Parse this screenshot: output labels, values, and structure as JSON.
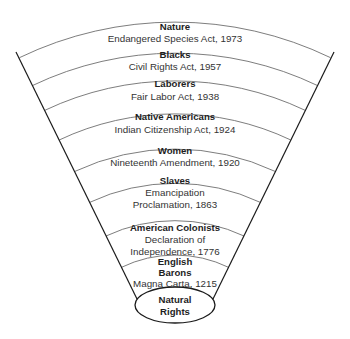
{
  "diagram": {
    "bands": [
      {
        "group": "Nature",
        "law_lines": [
          "Endangered Species Act, 1973"
        ]
      },
      {
        "group": "Blacks",
        "law_lines": [
          "Civil Rights Act, 1957"
        ]
      },
      {
        "group": "Laborers",
        "law_lines": [
          "Fair Labor Act, 1938"
        ]
      },
      {
        "group": "Native Americans",
        "law_lines": [
          "Indian Citizenship Act, 1924"
        ]
      },
      {
        "group": "Women",
        "law_lines": [
          "Nineteenth Amendment, 1920"
        ]
      },
      {
        "group": "Slaves",
        "law_lines": [
          "Emancipation",
          "Proclamation, 1863"
        ]
      },
      {
        "group": "American Colonists",
        "law_lines": [
          "Declaration of",
          "Independence, 1776"
        ]
      },
      {
        "group_lines": [
          "English",
          "Barons"
        ],
        "law_lines": [
          "Magna Carta, 1215"
        ]
      }
    ],
    "core": {
      "label_lines": [
        "Natural",
        "Rights"
      ]
    },
    "colors": {
      "edge": "#1a1a1a",
      "arc": "#6e6e6e",
      "text": "#1e1e1e",
      "background": "#ffffff"
    }
  }
}
